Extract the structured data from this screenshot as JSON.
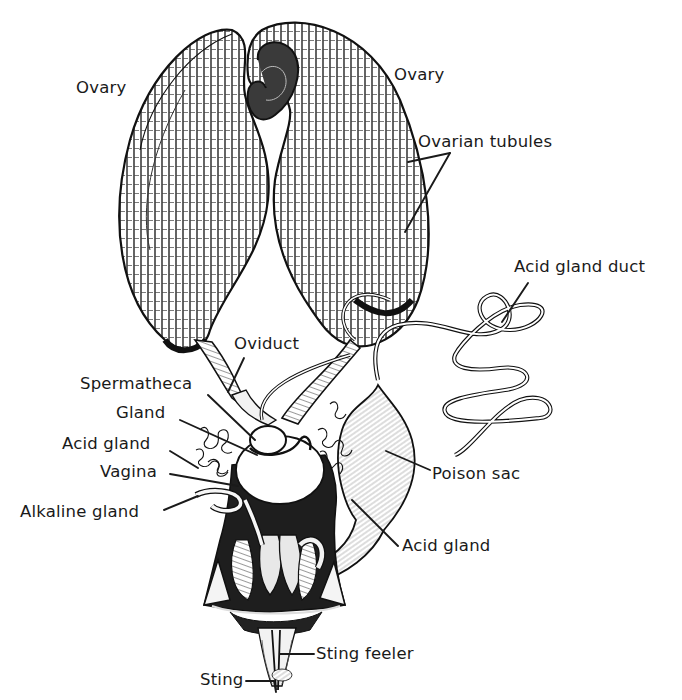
{
  "diagram": {
    "colors": {
      "ink": "#1a1a1a",
      "paper": "#ffffff",
      "shade": "#2b2b2b"
    },
    "labels": [
      {
        "id": "ovary-left",
        "text": "Ovary",
        "x": 76,
        "y": 80,
        "leader": []
      },
      {
        "id": "ovary-right",
        "text": "Ovary",
        "x": 394,
        "y": 67,
        "leader": []
      },
      {
        "id": "ovarian-tubules",
        "text": "Ovarian tubules",
        "x": 418,
        "y": 134,
        "leader": [
          [
            450,
            153,
            408,
            162
          ],
          [
            450,
            153,
            405,
            232
          ]
        ]
      },
      {
        "id": "acid-gland-duct",
        "text": "Acid gland duct",
        "x": 514,
        "y": 259,
        "leader": [
          [
            528,
            283,
            502,
            322
          ]
        ]
      },
      {
        "id": "oviduct",
        "text": "Oviduct",
        "x": 234,
        "y": 336,
        "leader": [
          [
            244,
            358,
            228,
            392
          ]
        ]
      },
      {
        "id": "spermatheca",
        "text": "Spermatheca",
        "x": 80,
        "y": 376,
        "leader": [
          [
            208,
            395,
            255,
            440
          ]
        ]
      },
      {
        "id": "gland",
        "text": "Gland",
        "x": 116,
        "y": 405,
        "leader": [
          [
            180,
            420,
            257,
            455
          ]
        ]
      },
      {
        "id": "acid-gland-left",
        "text": "Acid gland",
        "x": 62,
        "y": 436,
        "leader": [
          [
            170,
            451,
            198,
            468
          ]
        ]
      },
      {
        "id": "vagina",
        "text": "Vagina",
        "x": 100,
        "y": 464,
        "leader": [
          [
            170,
            474,
            238,
            486
          ]
        ]
      },
      {
        "id": "alkaline-gland",
        "text": "Alkaline gland",
        "x": 20,
        "y": 504,
        "leader": [
          [
            164,
            510,
            198,
            496
          ]
        ]
      },
      {
        "id": "poison-sac",
        "text": "Poison sac",
        "x": 432,
        "y": 466,
        "leader": [
          [
            430,
            470,
            386,
            451
          ]
        ]
      },
      {
        "id": "acid-gland-right",
        "text": "Acid gland",
        "x": 402,
        "y": 538,
        "leader": [
          [
            398,
            546,
            352,
            500
          ]
        ]
      },
      {
        "id": "sting-feeler",
        "text": "Sting feeler",
        "x": 316,
        "y": 646,
        "leader": [
          [
            314,
            654,
            280,
            654
          ]
        ]
      },
      {
        "id": "sting",
        "text": "Sting",
        "x": 200,
        "y": 672,
        "leader": [
          [
            246,
            681,
            274,
            681
          ],
          [
            274,
            681,
            276,
            692
          ]
        ]
      }
    ]
  }
}
